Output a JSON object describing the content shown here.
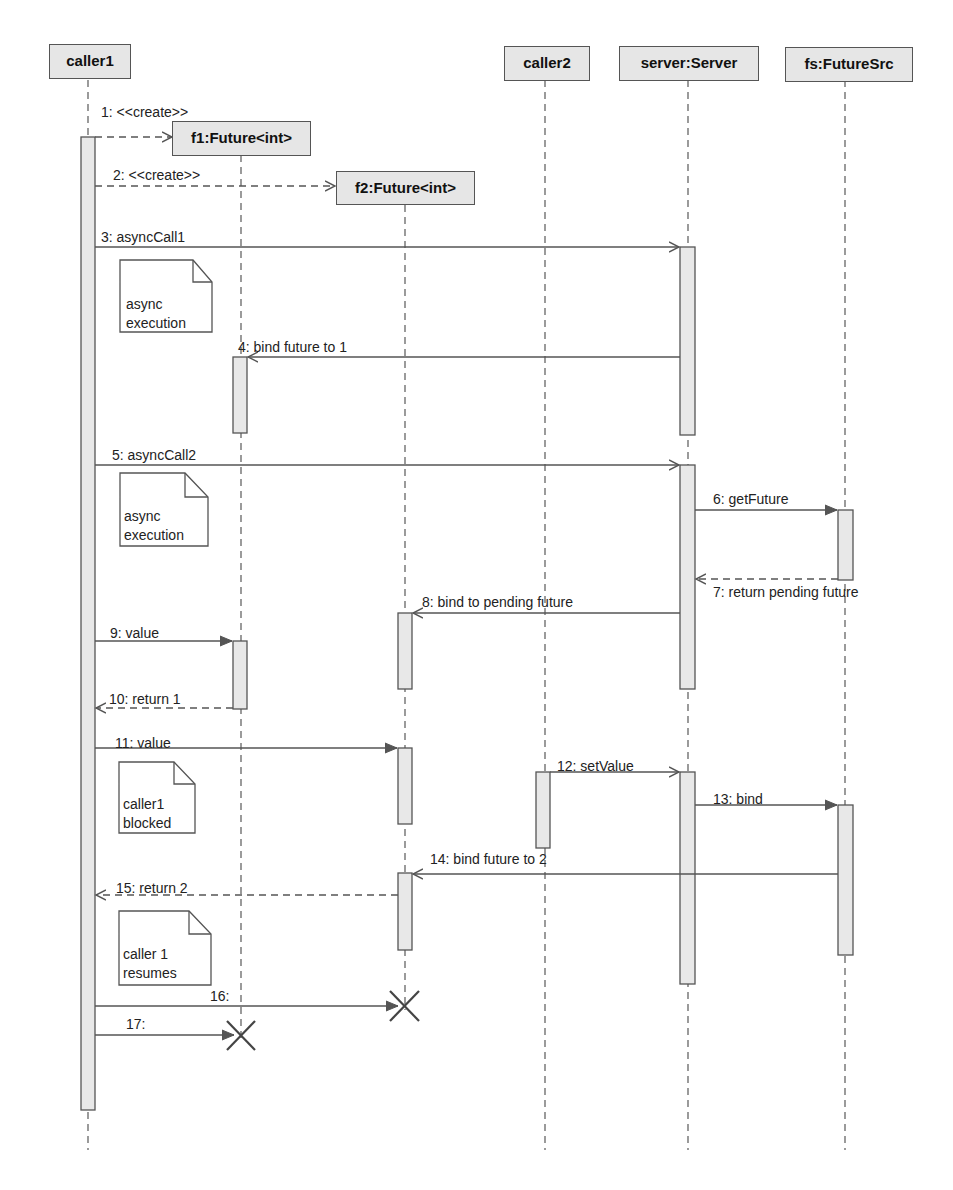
{
  "diagram": {
    "type": "UML sequence diagram",
    "lifelines": [
      {
        "id": "caller1",
        "label": "caller1"
      },
      {
        "id": "f1",
        "label": "f1:Future<int>"
      },
      {
        "id": "f2",
        "label": "f2:Future<int>"
      },
      {
        "id": "caller2",
        "label": "caller2"
      },
      {
        "id": "server",
        "label": "server:Server"
      },
      {
        "id": "fs",
        "label": "fs:FutureSrc"
      }
    ],
    "messages": [
      {
        "n": 1,
        "label": "1: <<create>>",
        "from": "caller1",
        "to": "f1",
        "style": "dashed-create"
      },
      {
        "n": 2,
        "label": "2:  <<create>>",
        "from": "caller1",
        "to": "f2",
        "style": "dashed-create"
      },
      {
        "n": 3,
        "label": "3: asyncCall1",
        "from": "caller1",
        "to": "server",
        "style": "async"
      },
      {
        "n": 4,
        "label": "4: bind future to 1",
        "from": "server",
        "to": "f1",
        "style": "async"
      },
      {
        "n": 5,
        "label": "5: asyncCall2",
        "from": "caller1",
        "to": "server",
        "style": "async"
      },
      {
        "n": 6,
        "label": "6: getFuture",
        "from": "server",
        "to": "fs",
        "style": "sync"
      },
      {
        "n": 7,
        "label": "7: return pending future",
        "from": "fs",
        "to": "server",
        "style": "return"
      },
      {
        "n": 8,
        "label": "8: bind to pending future",
        "from": "server",
        "to": "f2",
        "style": "async"
      },
      {
        "n": 9,
        "label": "9: value",
        "from": "caller1",
        "to": "f1",
        "style": "sync"
      },
      {
        "n": 10,
        "label": "10: return 1",
        "from": "f1",
        "to": "caller1",
        "style": "return"
      },
      {
        "n": 11,
        "label": "11: value",
        "from": "caller1",
        "to": "f2",
        "style": "sync"
      },
      {
        "n": 12,
        "label": "12: setValue",
        "from": "caller2",
        "to": "server",
        "style": "async"
      },
      {
        "n": 13,
        "label": "13: bind",
        "from": "server",
        "to": "fs",
        "style": "sync"
      },
      {
        "n": 14,
        "label": "14: bind future to 2",
        "from": "fs",
        "to": "f2",
        "style": "async"
      },
      {
        "n": 15,
        "label": "15: return 2",
        "from": "f2",
        "to": "caller1",
        "style": "return"
      },
      {
        "n": 16,
        "label": "16:",
        "from": "caller1",
        "to": "f2",
        "style": "destroy"
      },
      {
        "n": 17,
        "label": "17:",
        "from": "caller1",
        "to": "f1",
        "style": "destroy"
      }
    ],
    "notes": [
      {
        "text": "async\nexecution"
      },
      {
        "text": "async\nexecution"
      },
      {
        "text": "caller1\nblocked"
      },
      {
        "text": "caller 1\nresumes"
      }
    ],
    "colors": {
      "box_fill": "#e6e6e6",
      "line": "#555555",
      "activation_fill": "#e8e8e8"
    }
  }
}
